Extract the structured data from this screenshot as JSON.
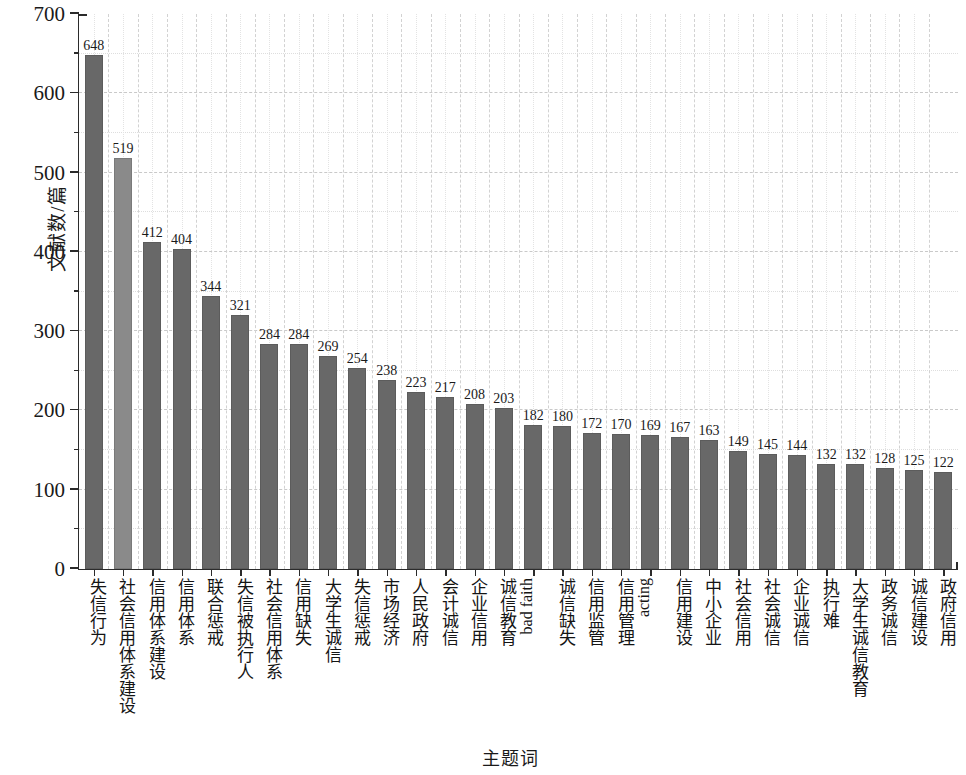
{
  "chart_data": {
    "type": "bar",
    "title": "",
    "xlabel": "主题词",
    "ylabel": "文献数/篇",
    "ylim": [
      0,
      700
    ],
    "ytick_values": [
      0,
      100,
      200,
      300,
      400,
      500,
      600,
      700
    ],
    "ytick_labels": [
      "0",
      "100",
      "200",
      "300",
      "400",
      "500",
      "600",
      "700"
    ],
    "grid": true,
    "legend": "none",
    "categories": [
      "失信行为",
      "社会信用体系建设",
      "信用体系建设",
      "信用体系",
      "联合惩戒",
      "失信被执行人",
      "社会信用体系",
      "信用缺失",
      "大学生诚信",
      "失信惩戒",
      "市场经济",
      "人民政府",
      "会计诚信",
      "企业信用",
      "诚信教育",
      "bad faith",
      "诚信缺失",
      "信用监管",
      "信用管理",
      "acting",
      "信用建设",
      "中小企业",
      "社会信用",
      "社会诚信",
      "企业诚信",
      "执行难",
      "大学生诚信教育",
      "政务诚信",
      "诚信建设",
      "政府信用"
    ],
    "values": [
      648,
      519,
      412,
      404,
      344,
      321,
      284,
      284,
      269,
      254,
      238,
      223,
      217,
      208,
      203,
      182,
      180,
      172,
      170,
      169,
      167,
      163,
      149,
      145,
      144,
      132,
      132,
      128,
      125,
      122
    ],
    "bar_colors": {
      "default": "#686868",
      "highlight": "#8a8a8a"
    },
    "highlight_index": 1
  }
}
